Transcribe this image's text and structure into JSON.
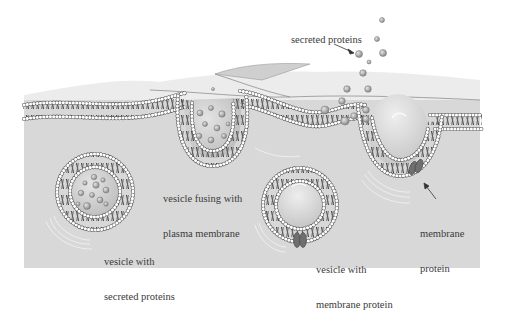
{
  "diagram": {
    "type": "biology-illustration",
    "colors": {
      "background": "#ffffff",
      "cytoplasm": "#d9d9d9",
      "extracellular": "#ebebeb",
      "membrane_head": "#ffffff",
      "membrane_head_stroke": "#555555",
      "membrane_tail": "#444444",
      "vesicle_lumen": "#c8c8c8",
      "protein_sphere": "#9a9a9a",
      "membrane_protein": "#6e6e6e"
    },
    "labels": {
      "secreted_proteins": "secreted proteins",
      "vesicle_fusing": [
        "vesicle fusing with",
        "plasma membrane"
      ],
      "vesicle_secreted": [
        "vesicle with",
        "secreted proteins"
      ],
      "vesicle_membrane_protein": [
        "vesicle with",
        "membrane protein"
      ],
      "membrane_protein": [
        "membrane",
        "protein"
      ]
    },
    "components": [
      {
        "name": "plasma-membrane",
        "description": "lipid bilayer across the cell surface"
      },
      {
        "name": "fusing-vesicle",
        "description": "vesicle merged into the membrane, releasing proteins"
      },
      {
        "name": "vesicle-with-secreted-proteins",
        "description": "free vesicle holding protein spheres"
      },
      {
        "name": "vesicle-with-membrane-protein",
        "description": "free vesicle with an embedded membrane protein"
      },
      {
        "name": "membrane-invagination",
        "description": "pocket in the membrane carrying a membrane protein"
      },
      {
        "name": "secreted-proteins",
        "description": "protein spheres released outside the cell"
      }
    ]
  }
}
